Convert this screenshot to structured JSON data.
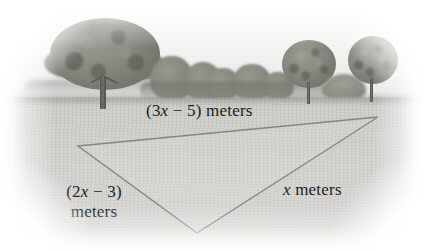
{
  "figure": {
    "kind": "geometry-diagram-over-photograph",
    "scene_description": "grayscale photograph of a grassy field with trees along the horizon",
    "shape": "triangle"
  },
  "labels": {
    "top": {
      "open_paren": "(",
      "coefficient": "3",
      "variable": "x",
      "operator": " − ",
      "constant": "5",
      "close_paren": ")",
      "unit": " meters",
      "full_text": "(3x − 5) meters"
    },
    "left": {
      "open_paren": "(",
      "coefficient": "2",
      "variable": "x",
      "operator": " − ",
      "constant": "3",
      "close_paren": ")",
      "unit": "meters",
      "full_text": "(2x − 3) meters"
    },
    "right": {
      "variable": "x",
      "unit": " meters",
      "full_text": "x meters"
    }
  },
  "triangle": {
    "vertices": [
      {
        "name": "left-vertex",
        "x": 78,
        "y": 146
      },
      {
        "name": "right-vertex",
        "x": 378,
        "y": 117
      },
      {
        "name": "bottom-vertex",
        "x": 197,
        "y": 233
      }
    ],
    "stroke_color": "#8a8a83",
    "stroke_width": 1.4,
    "fill": "rgba(255,255,255,0.06)"
  },
  "scene": {
    "trees": [
      {
        "name": "large-left-oak",
        "x": 44,
        "y": 18
      },
      {
        "name": "right-tree",
        "x": 278,
        "y": 40
      },
      {
        "name": "far-right-tree",
        "x": 344,
        "y": 36
      }
    ],
    "horizon_y": 97,
    "sky_color": "#f6f6f5",
    "ground_color": "#d6d6d2"
  }
}
